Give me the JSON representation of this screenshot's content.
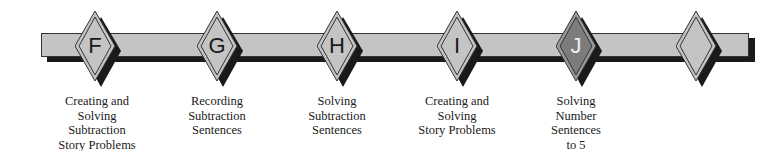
{
  "timeline": {
    "colors": {
      "bar": "#c4c4c4",
      "shadow": "#1a1a1a",
      "diamond": "#c4c4c4",
      "active_diamond": "#8a8a8a",
      "outline": "#333333"
    },
    "markers": [
      {
        "letter": "F",
        "label_lines": [
          "Creating and",
          "Solving",
          "Subtraction",
          "Story Problems"
        ],
        "active": false
      },
      {
        "letter": "G",
        "label_lines": [
          "Recording",
          "Subtraction",
          "Sentences"
        ],
        "active": false
      },
      {
        "letter": "H",
        "label_lines": [
          "Solving",
          "Subtraction",
          "Sentences"
        ],
        "active": false
      },
      {
        "letter": "I",
        "label_lines": [
          "Creating and",
          "Solving",
          "Story Problems"
        ],
        "active": false
      },
      {
        "letter": "J",
        "label_lines": [
          "Solving",
          "Number",
          "Sentences",
          "to 5"
        ],
        "active": true
      },
      {
        "letter": "",
        "label_lines": [],
        "active": false
      }
    ]
  }
}
